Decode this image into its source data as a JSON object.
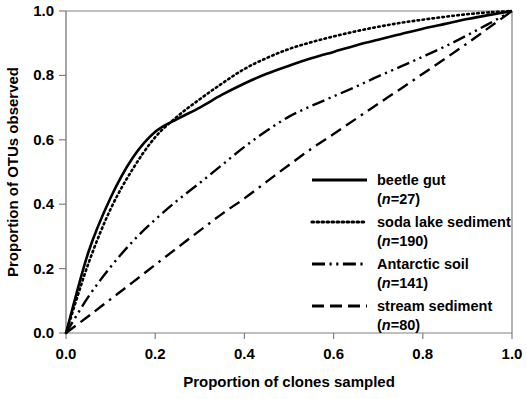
{
  "chart_data": {
    "type": "line",
    "title": "",
    "xlabel": "Proportion of clones sampled",
    "ylabel": "Proportion of OTUs observed",
    "xlim": [
      0.0,
      1.0
    ],
    "ylim": [
      0.0,
      1.0
    ],
    "xticks": [
      "0.0",
      "0.2",
      "0.4",
      "0.6",
      "0.8",
      "1.0"
    ],
    "yticks": [
      "0.0",
      "0.2",
      "0.4",
      "0.6",
      "0.8",
      "1.0"
    ],
    "grid": false,
    "legend_position": "center-right-inside",
    "x": [
      0.0,
      0.05,
      0.1,
      0.15,
      0.2,
      0.25,
      0.3,
      0.35,
      0.4,
      0.45,
      0.5,
      0.55,
      0.6,
      0.65,
      0.7,
      0.75,
      0.8,
      0.85,
      0.9,
      0.95,
      1.0
    ],
    "series": [
      {
        "name": "beetle gut",
        "n_label": "(n=27)",
        "n": 27,
        "style": "solid",
        "color": "#000000",
        "values": [
          0.0,
          0.25,
          0.42,
          0.545,
          0.625,
          0.665,
          0.7,
          0.74,
          0.775,
          0.805,
          0.83,
          0.853,
          0.873,
          0.893,
          0.911,
          0.928,
          0.945,
          0.96,
          0.975,
          0.988,
          1.0
        ]
      },
      {
        "name": "soda lake sediment",
        "n_label": "(n=190)",
        "n": 190,
        "style": "dotted",
        "color": "#000000",
        "values": [
          0.0,
          0.215,
          0.385,
          0.51,
          0.608,
          0.673,
          0.726,
          0.775,
          0.82,
          0.854,
          0.882,
          0.903,
          0.921,
          0.937,
          0.951,
          0.963,
          0.973,
          0.982,
          0.99,
          0.996,
          1.0
        ]
      },
      {
        "name": "Antarctic soil",
        "n_label": "(n=141)",
        "n": 141,
        "style": "dash-dot-dot",
        "color": "#000000",
        "values": [
          0.0,
          0.112,
          0.205,
          0.285,
          0.352,
          0.412,
          0.466,
          0.522,
          0.578,
          0.628,
          0.672,
          0.705,
          0.735,
          0.765,
          0.797,
          0.827,
          0.858,
          0.89,
          0.925,
          0.962,
          1.0
        ]
      },
      {
        "name": "stream sediment",
        "n_label": "(n=80)",
        "n": 80,
        "style": "dashed",
        "color": "#000000",
        "values": [
          0.0,
          0.052,
          0.105,
          0.158,
          0.212,
          0.265,
          0.318,
          0.37,
          0.418,
          0.47,
          0.522,
          0.572,
          0.618,
          0.665,
          0.712,
          0.758,
          0.805,
          0.852,
          0.9,
          0.95,
          1.0
        ]
      }
    ]
  },
  "axes": {
    "frame_color": "#808080",
    "tick_color": "#808080"
  }
}
